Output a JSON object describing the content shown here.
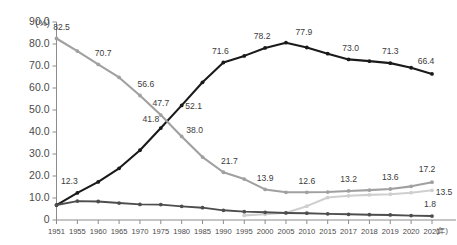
{
  "chart_data": {
    "type": "line",
    "title": "",
    "subtitle": "",
    "xlabel": "(年)",
    "ylabel": "(%)",
    "ylim": [
      0,
      90
    ],
    "grid": false,
    "legend_position": "none",
    "y_ticks": [
      "90.0",
      "80.0",
      "70.0",
      "60.0",
      "50.0",
      "40.0",
      "30.0",
      "20.0",
      "10.0",
      "0"
    ],
    "y_tick_values": [
      90,
      80,
      70,
      60,
      50,
      40,
      30,
      20,
      10,
      0
    ],
    "categories": [
      "1951",
      "1955",
      "1960",
      "1965",
      "1970",
      "1975",
      "1980",
      "1985",
      "1990",
      "1995",
      "2000",
      "2005",
      "2010",
      "2015",
      "2017",
      "2018",
      "2019",
      "2020",
      "2021"
    ],
    "series": [
      {
        "name": "series-dark-rising",
        "color": "#1a1a1a",
        "width": 2.1,
        "values": [
          6.8,
          12.3,
          17.3,
          23.5,
          31.7,
          41.8,
          52.1,
          62.6,
          71.6,
          74.6,
          78.2,
          80.6,
          78.4,
          75.6,
          73.0,
          72.2,
          71.3,
          69.2,
          66.4
        ],
        "labels": [
          {
            "index": 1,
            "text": "12.3",
            "dx": -8,
            "dy": -11
          },
          {
            "index": 5,
            "text": "41.8",
            "dx": -10,
            "dy": -8
          },
          {
            "index": 6,
            "text": "52.1",
            "dx": 12,
            "dy": 1
          },
          {
            "index": 8,
            "text": "71.6",
            "dx": -3,
            "dy": -11
          },
          {
            "index": 10,
            "text": "78.2",
            "dx": -3,
            "dy": -11
          },
          {
            "index": 11,
            "text": "77.9",
            "dx": 18,
            "dy": -10
          },
          {
            "index": 14,
            "text": "73.0",
            "dx": 2,
            "dy": -11
          },
          {
            "index": 16,
            "text": "71.3",
            "dx": 0,
            "dy": -11
          },
          {
            "index": 18,
            "text": "66.4",
            "dx": -6,
            "dy": -12
          }
        ]
      },
      {
        "name": "series-gray-falling",
        "color": "#a0a0a0",
        "width": 2.1,
        "values": [
          82.5,
          76.8,
          70.7,
          64.8,
          56.6,
          47.7,
          38.0,
          28.6,
          21.7,
          18.6,
          13.9,
          12.6,
          12.6,
          12.7,
          13.2,
          13.6,
          14.1,
          15.3,
          17.2
        ],
        "labels": [
          {
            "index": 0,
            "text": "82.5",
            "dx": 5,
            "dy": -11
          },
          {
            "index": 2,
            "text": "70.7",
            "dx": 5,
            "dy": -11
          },
          {
            "index": 4,
            "text": "56.6",
            "dx": 6,
            "dy": -11
          },
          {
            "index": 5,
            "text": "47.7",
            "dx": 0,
            "dy": -11
          },
          {
            "index": 6,
            "text": "38.0",
            "dx": 13,
            "dy": -6
          },
          {
            "index": 8,
            "text": "21.7",
            "dx": 6,
            "dy": -11
          },
          {
            "index": 10,
            "text": "13.9",
            "dx": 0,
            "dy": -11
          },
          {
            "index": 12,
            "text": "12.6",
            "dx": 0,
            "dy": -11
          },
          {
            "index": 14,
            "text": "13.2",
            "dx": 0,
            "dy": -11
          },
          {
            "index": 16,
            "text": "13.6",
            "dx": 0,
            "dy": -11
          },
          {
            "index": 18,
            "text": "17.2",
            "dx": -5,
            "dy": -12
          }
        ]
      },
      {
        "name": "series-light-gray-rising",
        "color": "#cfcfcf",
        "width": 2.1,
        "values": [
          null,
          null,
          null,
          null,
          null,
          null,
          null,
          null,
          null,
          2.1,
          2.6,
          3.3,
          6.3,
          10.2,
          11.0,
          11.4,
          11.7,
          12.4,
          13.5
        ],
        "labels": [
          {
            "index": 18,
            "text": "13.5",
            "dx": 12,
            "dy": 2
          }
        ]
      },
      {
        "name": "series-dark-gray-flat",
        "color": "#4d4d4d",
        "width": 1.9,
        "values": [
          6.8,
          8.6,
          8.4,
          7.7,
          7.1,
          7.0,
          6.2,
          5.6,
          4.4,
          3.8,
          3.5,
          3.2,
          3.1,
          2.8,
          2.6,
          2.4,
          2.3,
          2.0,
          1.8
        ],
        "labels": [
          {
            "index": 18,
            "text": "1.8",
            "dx": -2,
            "dy": -11
          }
        ]
      }
    ]
  },
  "axis": {
    "y_unit": "(%)",
    "x_unit": "(年)"
  }
}
